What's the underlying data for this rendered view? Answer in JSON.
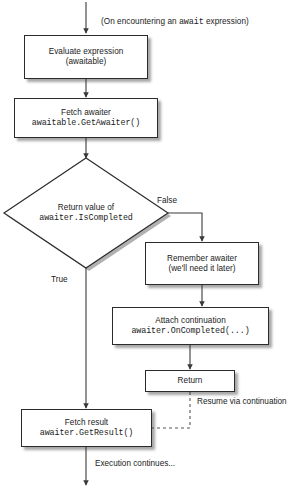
{
  "diagram": {
    "title_note": "",
    "entry_label": "(On encountering an await expression)",
    "entry_label_plain": "(On encountering an ",
    "entry_label_code": "await",
    "entry_label_tail": " expression)",
    "nodes": {
      "evaluate": {
        "line1": "Evaluate expression",
        "line2": "(awaitable)"
      },
      "fetch_awaiter": {
        "line1": "Fetch awaiter",
        "line2": "awaitable.GetAwaiter()"
      },
      "decision": {
        "line1": "Return value of",
        "line2": "awaiter.IsCompleted"
      },
      "remember": {
        "line1": "Remember awaiter",
        "line2": "(we'll need it later)"
      },
      "attach": {
        "line1": "Attach continuation",
        "line2": "awaiter.OnCompleted(...)"
      },
      "return": {
        "line1": "Return"
      },
      "fetch_result": {
        "line1": "Fetch result",
        "line2": "awaiter.GetResult()"
      }
    },
    "edge_labels": {
      "true": "True",
      "false": "False",
      "resume_line1": "Resume via",
      "resume_line2": "continuation",
      "execution": "Execution continues..."
    },
    "colors": {
      "stroke": "#2b2b2b",
      "fill": "#ffffff",
      "text": "#1a1a1a",
      "shadow": "rgba(60,60,60,0.45)",
      "background": "#ffffff"
    }
  }
}
